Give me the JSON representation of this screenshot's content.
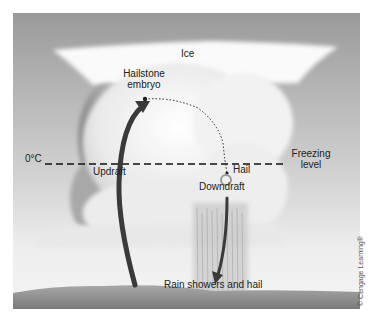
{
  "diagram": {
    "labels": {
      "ice": "Ice",
      "hailstone_embryo_line1": "Hailstone",
      "hailstone_embryo_line2": "embryo",
      "zero_c": "0°C",
      "freezing_level_line1": "Freezing",
      "freezing_level_line2": "level",
      "updraft": "Updraft",
      "hail": "Hail",
      "downdraft": "Downdraft",
      "rain": "Rain showers and hail"
    },
    "copyright": "© Cengage Learning®",
    "colors": {
      "sky_top": "#9a9a9a",
      "sky_bottom": "#f4f4f4",
      "cloud": "#f7f7f7",
      "cloud_shadow": "#8a8a8a",
      "arrow": "#3a3a3a",
      "ground": "#8c8c8c"
    }
  }
}
